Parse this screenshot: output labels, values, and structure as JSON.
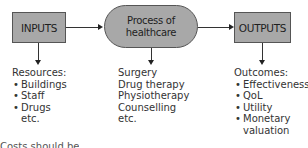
{
  "diagram": {
    "nodes": {
      "inputs": {
        "label": "INPUTS"
      },
      "process": {
        "line1": "Process of",
        "line2": "healthcare"
      },
      "outputs": {
        "label": "OUTPUTS"
      }
    },
    "inputs_detail": {
      "heading": "Resources:",
      "items": [
        "Buildings",
        "Staff",
        "Drugs"
      ],
      "trailing": "etc."
    },
    "process_detail": {
      "items": [
        "Surgery",
        "Drug therapy",
        "Physiotherapy",
        "Counselling",
        "etc."
      ]
    },
    "outputs_detail": {
      "heading": "Outcomes:",
      "items": [
        "Effectiveness",
        "QoL",
        "Utility",
        "Monetary"
      ],
      "continuation": "valuation"
    },
    "footer_note": "Costs should be"
  },
  "colors": {
    "box_fill": "#a8a8a8",
    "box_border": "#555555",
    "line": "#333333",
    "text": "#333333"
  }
}
